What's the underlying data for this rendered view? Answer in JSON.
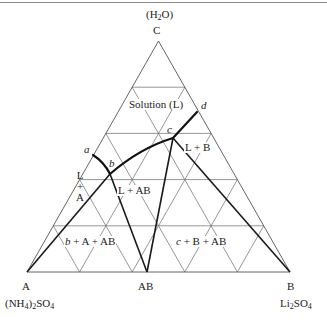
{
  "diagram": {
    "type": "ternary-phase-diagram",
    "vertices": {
      "top": {
        "letter": "C",
        "formula_main": "(H",
        "formula_sub": "2",
        "formula_tail": "O)"
      },
      "left": {
        "letter": "A",
        "formula_part1": "(NH",
        "formula_sub1": "4",
        "formula_part2": ")",
        "formula_sub2": "2",
        "formula_part3": "SO",
        "formula_sub3": "4"
      },
      "right": {
        "letter": "B",
        "formula_part1": "Li",
        "formula_sub1": "2",
        "formula_part2": "SO",
        "formula_sub2": "4"
      },
      "compound": {
        "label": "AB"
      }
    },
    "points": {
      "a": "a",
      "b": "b",
      "c": "c",
      "d": "d"
    },
    "regions": {
      "solution": "Solution (L)",
      "l_plus_b": "L + B",
      "l_plus_ab": "L + AB",
      "l_plus_a_line1": "L",
      "l_plus_a_line2": "+",
      "l_plus_a_line3": "A",
      "b_a_ab_prefix": "b",
      "b_a_ab_rest": " + A + AB",
      "c_b_ab_prefix": "c",
      "c_b_ab_rest": " + B + AB"
    },
    "grid_interval": 0.2
  }
}
